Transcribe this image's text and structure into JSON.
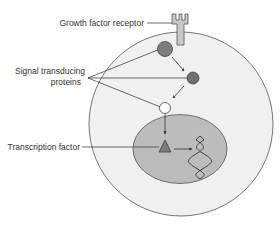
{
  "diagram": {
    "labels": {
      "receptor": "Growth factor receptor",
      "signal_line1": "Signal transducing",
      "signal_line2": "proteins",
      "transcription": "Transcription factor"
    },
    "colors": {
      "cell_fill": "#f0f0f0",
      "cell_stroke": "#555555",
      "nucleus_fill": "#b9b9b9",
      "protein_dark": "#7a7a7a",
      "protein_light": "#ffffff",
      "receptor_fill": "#c8c8c8",
      "line": "#444444"
    },
    "components": [
      "cell-membrane",
      "nucleus",
      "growth-factor-receptor",
      "signal-protein-1",
      "signal-protein-2",
      "signal-protein-3",
      "transcription-factor",
      "dna-helix"
    ]
  }
}
